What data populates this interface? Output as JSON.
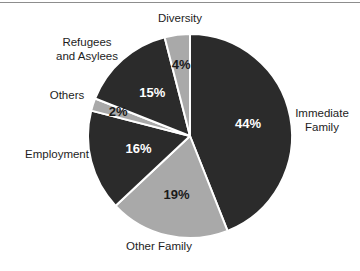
{
  "chart_data": {
    "type": "pie",
    "title": "",
    "subtitle": "",
    "xlabel": "",
    "ylabel": "",
    "legend_position": "none",
    "grid": false,
    "value_suffix": "%",
    "start_angle_deg": 0,
    "direction": "clockwise",
    "categories": [
      "Immediate Family",
      "Other Family",
      "Employment",
      "Others",
      "Refugees and Asylees",
      "Diversity"
    ],
    "values": [
      44,
      19,
      16,
      2,
      15,
      4
    ],
    "slices": [
      {
        "label": "Immediate Family",
        "label_lines": "Immediate\nFamily",
        "value": 44,
        "value_text": "44%",
        "fill": "#2b2b2b",
        "value_color": "#ffffff",
        "label_position": "right"
      },
      {
        "label": "Other Family",
        "label_lines": "Other Family",
        "value": 19,
        "value_text": "19%",
        "fill": "#a9a9a9",
        "value_color": "#1a1a1a",
        "label_position": "bottom"
      },
      {
        "label": "Employment",
        "label_lines": "Employment",
        "value": 16,
        "value_text": "16%",
        "fill": "#2b2b2b",
        "value_color": "#ffffff",
        "label_position": "left"
      },
      {
        "label": "Others",
        "label_lines": "Others",
        "value": 2,
        "value_text": "2%",
        "fill": "#a9a9a9",
        "value_color": "#1a1a1a",
        "label_position": "left"
      },
      {
        "label": "Refugees and Asylees",
        "label_lines": "Refugees\nand Asylees",
        "value": 15,
        "value_text": "15%",
        "fill": "#2b2b2b",
        "value_color": "#ffffff",
        "label_position": "upper-left"
      },
      {
        "label": "Diversity",
        "label_lines": "Diversity",
        "value": 4,
        "value_text": "4%",
        "fill": "#a9a9a9",
        "value_color": "#1a1a1a",
        "label_position": "top"
      }
    ],
    "colors": {
      "dark_slice": "#2b2b2b",
      "light_slice": "#a9a9a9",
      "separator": "#ffffff",
      "background": "#ffffff",
      "text": "#1d1d1d",
      "rule": "#8d8d8d"
    }
  }
}
